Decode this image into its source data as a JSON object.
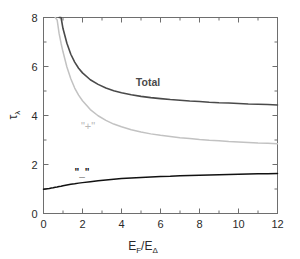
{
  "figure": {
    "background": "#ffffff",
    "frame_color": "#6e6e6e"
  },
  "annotations": {
    "total_label": "Total",
    "plus_label": "\"+\"",
    "minus_label": "\"_\""
  },
  "axis": {
    "x_title_main": "E",
    "x_title_sub1": "F",
    "x_title_slash": "/E",
    "x_title_sub2": "Δ",
    "y_title_main": "τ",
    "y_title_sub": "λ"
  },
  "chart_data": {
    "type": "line",
    "title": "",
    "xlabel": "E_F/E_Δ",
    "ylabel": "τ_λ",
    "xlim": [
      0,
      12
    ],
    "ylim": [
      0,
      8
    ],
    "xticks": [
      0,
      2,
      4,
      6,
      8,
      10,
      12
    ],
    "yticks": [
      0,
      2,
      4,
      6,
      8
    ],
    "xticks_minor": [
      1,
      3,
      5,
      7,
      9,
      11
    ],
    "yticks_minor": [
      1,
      3,
      5,
      7
    ],
    "grid": false,
    "legend": "none (inline curve annotations)",
    "x": [
      0.0,
      0.1,
      0.2,
      0.3,
      0.4,
      0.5,
      0.6,
      0.7,
      0.8,
      0.9,
      1.0,
      1.2,
      1.4,
      1.6,
      1.8,
      2.0,
      2.4,
      2.8,
      3.2,
      3.6,
      4.0,
      4.5,
      5.0,
      5.5,
      6.0,
      6.5,
      7.0,
      7.5,
      8.0,
      8.5,
      9.0,
      9.5,
      10.0,
      10.5,
      11.0,
      11.5,
      12.0
    ],
    "series": [
      {
        "name": "Total",
        "color": "#4a4a4a",
        "linewidth": 1.6,
        "label_text": "Total",
        "values": [
          null,
          null,
          null,
          null,
          null,
          null,
          null,
          null,
          8.35,
          8.0,
          7.55,
          6.95,
          6.5,
          6.18,
          5.93,
          5.74,
          5.46,
          5.27,
          5.12,
          5.01,
          4.93,
          4.85,
          4.78,
          4.73,
          4.69,
          4.65,
          4.62,
          4.59,
          4.57,
          4.54,
          4.52,
          4.51,
          4.49,
          4.47,
          4.46,
          4.45,
          4.43
        ]
      },
      {
        "name": "\"+\"",
        "color": "#c2c2c2",
        "linewidth": 1.5,
        "label_text": "\"+\"",
        "values": [
          null,
          null,
          null,
          null,
          null,
          null,
          8.3,
          7.9,
          7.35,
          6.95,
          6.6,
          5.98,
          5.5,
          5.12,
          4.83,
          4.6,
          4.24,
          3.99,
          3.8,
          3.65,
          3.54,
          3.42,
          3.33,
          3.25,
          3.19,
          3.14,
          3.09,
          3.06,
          3.02,
          2.99,
          2.97,
          2.94,
          2.92,
          2.9,
          2.88,
          2.87,
          2.85
        ]
      },
      {
        "name": "\"_\"",
        "color": "#111111",
        "linewidth": 1.5,
        "label_text": "\"_\"",
        "values": [
          0.99,
          1.0,
          1.01,
          1.02,
          1.04,
          1.05,
          1.07,
          1.08,
          1.1,
          1.11,
          1.13,
          1.16,
          1.19,
          1.21,
          1.24,
          1.26,
          1.3,
          1.34,
          1.37,
          1.4,
          1.43,
          1.45,
          1.47,
          1.49,
          1.51,
          1.52,
          1.54,
          1.55,
          1.56,
          1.57,
          1.58,
          1.59,
          1.6,
          1.61,
          1.62,
          1.625,
          1.63
        ]
      }
    ]
  }
}
